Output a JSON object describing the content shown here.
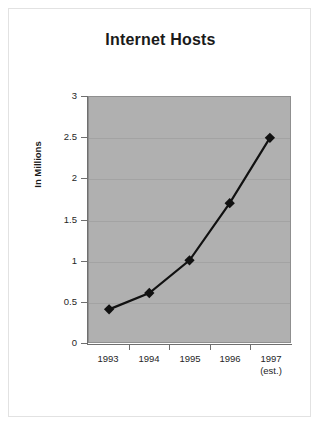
{
  "chart_data": {
    "type": "line",
    "title": "Internet Hosts",
    "xlabel": "",
    "ylabel": "In Millions",
    "categories": [
      "1993",
      "1994",
      "1995",
      "1996",
      "1997"
    ],
    "category_sublabels": [
      "",
      "",
      "",
      "",
      "(est.)"
    ],
    "values": [
      0.4,
      0.6,
      1.0,
      1.7,
      2.5
    ],
    "ylim": [
      0,
      3
    ],
    "ytick_labels": [
      "0",
      "0.5",
      "1",
      "1.5",
      "2",
      "2.5",
      "3"
    ],
    "ytick_values": [
      0,
      0.5,
      1,
      1.5,
      2,
      2.5,
      3
    ],
    "grid": true,
    "legend": "none",
    "series": [
      {
        "name": "Internet Hosts",
        "values": [
          0.4,
          0.6,
          1.0,
          1.7,
          2.5
        ],
        "marker": "diamond",
        "line_color": "#111111",
        "marker_color": "#111111"
      }
    ],
    "colors": {
      "plot_background": "#b0b0b0",
      "page_background": "#ffffff",
      "gridline": "#a3a3a3",
      "axis": "#6f6f6f",
      "text": "#262626",
      "title_text": "#1a1a1a"
    }
  }
}
